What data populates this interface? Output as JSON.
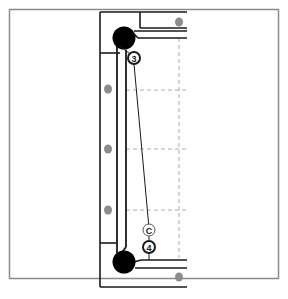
{
  "diagram": {
    "type": "technical-schematic",
    "colors": {
      "frame": "#8a8a8a",
      "line": "#1a1a1a",
      "roller": "#000000",
      "bolt": "#8c8c8c",
      "guide": "#9a9a9a",
      "background": "#ffffff"
    },
    "callouts": [
      {
        "id": "3",
        "label": "3",
        "style": "dark-ring"
      },
      {
        "id": "C",
        "label": "C",
        "style": "light-ring"
      },
      {
        "id": "4",
        "label": "4",
        "style": "dark-ring"
      }
    ],
    "components": {
      "rollers": [
        "top-roller",
        "bottom-roller"
      ],
      "bolts_count": 5,
      "guide_grid": "dashed"
    }
  }
}
